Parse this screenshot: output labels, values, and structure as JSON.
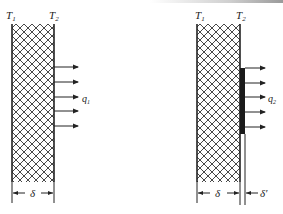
{
  "figure": {
    "left_panel": {
      "temp_left": "T",
      "temp_left_sub": "1",
      "temp_right": "T",
      "temp_right_sub": "2",
      "flux_label": "q",
      "flux_sub": "1",
      "thickness_label": "δ",
      "arrow_count": 5
    },
    "right_panel": {
      "temp_left": "T",
      "temp_left_sub": "1",
      "temp_right": "T",
      "temp_right_sub": "2",
      "flux_label": "q",
      "flux_sub": "2",
      "thickness_label": "δ",
      "coating_thickness_label": "δ′",
      "arrow_count": 5
    },
    "colors": {
      "line": "#222222",
      "hatch": "#333333",
      "coating": "#1a1a1a",
      "background": "#ffffff"
    }
  }
}
